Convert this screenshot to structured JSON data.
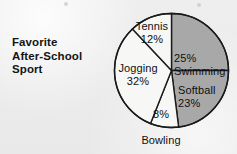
{
  "chart_data": {
    "type": "pie",
    "title": "Favorite After-School Sport",
    "title_lines": [
      "Favorite",
      "After-School",
      "Sport"
    ],
    "categories": [
      "Swimming",
      "Softball",
      "Bowling",
      "Jogging",
      "Tennis"
    ],
    "values": [
      25,
      23,
      8,
      32,
      12
    ],
    "value_suffix": "%",
    "total": 100,
    "legend": "none",
    "grid": false,
    "start_angle_deg": 0,
    "direction": "clockwise",
    "slices": [
      {
        "name": "Swimming",
        "value": 25,
        "label_pct": "25%",
        "label_name": "Swimming",
        "fill": "#a8a8a8",
        "start_deg": 0,
        "end_deg": 90
      },
      {
        "name": "Softball",
        "value": 23,
        "label_pct": "23%",
        "label_name": "Softball",
        "fill": "#a8a8a8",
        "start_deg": 90,
        "end_deg": 172.8
      },
      {
        "name": "Bowling",
        "value": 8,
        "label_pct": "8%",
        "label_name": "Bowling",
        "fill": "#f7f7f5",
        "start_deg": 172.8,
        "end_deg": 201.6
      },
      {
        "name": "Jogging",
        "value": 32,
        "label_pct": "32%",
        "label_name": "Jogging",
        "fill": "#f7f7f5",
        "start_deg": 201.6,
        "end_deg": 316.8
      },
      {
        "name": "Tennis",
        "value": 12,
        "label_pct": "12%",
        "label_name": "Tennis",
        "fill": "#f7f7f5",
        "start_deg": 316.8,
        "end_deg": 360
      }
    ],
    "colors": {
      "shaded": "#a8a8a8",
      "unshaded": "#f7f7f5",
      "outline": "#1a1a1a",
      "background": "#ececed",
      "text": "#101010"
    }
  },
  "title": {
    "line1": "Favorite",
    "line2": "After-School",
    "line3": "Sport"
  },
  "labels": {
    "tennis_name": "Tennis",
    "tennis_pct": "12%",
    "swimming_pct": "25%",
    "swimming_name": "Swimming",
    "softball_name": "Softball",
    "softball_pct": "23%",
    "bowling_pct": "8%",
    "bowling_name": "Bowling",
    "jogging_name": "Jogging",
    "jogging_pct": "32%"
  }
}
